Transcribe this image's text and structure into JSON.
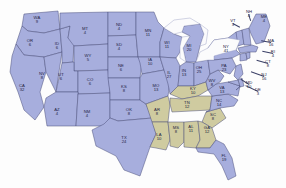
{
  "map": {
    "title": "United States Electoral College Map",
    "colors": {
      "blue_state_fill": "#a7aedd",
      "olive_state_fill": "#cfcba0",
      "border": "#4a4f7a",
      "background": "#ffffff",
      "lake_fill": "#fbfbfc",
      "label_text": "#23233f"
    },
    "legend_groups": [
      {
        "name": "blue-group",
        "color": "#a7aedd"
      },
      {
        "name": "olive-group",
        "color": "#cfcba0"
      }
    ]
  },
  "states": [
    {
      "ab": "WA",
      "ev": "9",
      "group": "blue",
      "x": 37,
      "y": 20,
      "lead": null
    },
    {
      "ab": "OR",
      "ev": "6",
      "group": "blue",
      "x": 30,
      "y": 43,
      "lead": null
    },
    {
      "ab": "CA",
      "ev": "32",
      "group": "blue",
      "x": 22,
      "y": 88,
      "lead": null
    },
    {
      "ab": "NV",
      "ev": "8",
      "group": "blue",
      "x": 42,
      "y": 76,
      "lead": null
    },
    {
      "ab": "ID",
      "ev": "6",
      "group": "blue",
      "x": 57,
      "y": 46,
      "lead": null
    },
    {
      "ab": "MT",
      "ev": "4",
      "group": "blue",
      "x": 85,
      "y": 31,
      "lead": null
    },
    {
      "ab": "WY",
      "ev": "5",
      "group": "blue",
      "x": 88,
      "y": 58,
      "lead": null
    },
    {
      "ab": "UT",
      "ev": "6",
      "group": "blue",
      "x": 61,
      "y": 77,
      "lead": null
    },
    {
      "ab": "CO",
      "ev": "6",
      "group": "blue",
      "x": 90,
      "y": 82,
      "lead": null
    },
    {
      "ab": "AZ",
      "ev": "4",
      "group": "blue",
      "x": 57,
      "y": 112,
      "lead": null
    },
    {
      "ab": "NM",
      "ev": "4",
      "group": "blue",
      "x": 87,
      "y": 114,
      "lead": null
    },
    {
      "ab": "ND",
      "ev": "4",
      "group": "blue",
      "x": 119,
      "y": 27,
      "lead": null
    },
    {
      "ab": "SD",
      "ev": "4",
      "group": "blue",
      "x": 119,
      "y": 47,
      "lead": null
    },
    {
      "ab": "NE",
      "ev": "6",
      "group": "blue",
      "x": 121,
      "y": 68,
      "lead": null
    },
    {
      "ab": "KS",
      "ev": "8",
      "group": "blue",
      "x": 124,
      "y": 89,
      "lead": null
    },
    {
      "ab": "OK",
      "ev": "8",
      "group": "blue",
      "x": 129,
      "y": 112,
      "lead": null
    },
    {
      "ab": "TX",
      "ev": "24",
      "group": "blue",
      "x": 124,
      "y": 140,
      "lead": null
    },
    {
      "ab": "MN",
      "ev": "11",
      "group": "blue",
      "x": 148,
      "y": 33,
      "lead": null
    },
    {
      "ab": "IA",
      "ev": "10",
      "group": "blue",
      "x": 150,
      "y": 62,
      "lead": null
    },
    {
      "ab": "MO",
      "ev": "13",
      "group": "blue",
      "x": 156,
      "y": 88,
      "lead": null
    },
    {
      "ab": "AR",
      "ev": "8",
      "group": "olive",
      "x": 157,
      "y": 112,
      "lead": null
    },
    {
      "ab": "LA",
      "ev": "10",
      "group": "olive",
      "x": 159,
      "y": 137,
      "lead": null
    },
    {
      "ab": "MS",
      "ev": "8",
      "group": "olive",
      "x": 176,
      "y": 130,
      "lead": null
    },
    {
      "ab": "AL",
      "ev": "11",
      "group": "olive",
      "x": 191,
      "y": 129,
      "lead": null
    },
    {
      "ab": "WI",
      "ev": "11",
      "group": "blue",
      "x": 167,
      "y": 45,
      "lead": null
    },
    {
      "ab": "IL",
      "ev": "27",
      "group": "blue",
      "x": 169,
      "y": 75,
      "lead": null
    },
    {
      "ab": "MI",
      "ev": "20",
      "group": "blue",
      "x": 189,
      "y": 48,
      "lead": null
    },
    {
      "ab": "IN",
      "ev": "13",
      "group": "blue",
      "x": 184,
      "y": 73,
      "lead": null
    },
    {
      "ab": "OH",
      "ev": "25",
      "group": "blue",
      "x": 199,
      "y": 70,
      "lead": null
    },
    {
      "ab": "KY",
      "ev": "10",
      "group": "olive",
      "x": 193,
      "y": 91,
      "lead": null
    },
    {
      "ab": "TN",
      "ev": "12",
      "group": "olive",
      "x": 187,
      "y": 105,
      "lead": null
    },
    {
      "ab": "WV",
      "ev": "8",
      "group": "blue",
      "x": 212,
      "y": 83,
      "lead": null
    },
    {
      "ab": "VA",
      "ev": "13",
      "group": "blue",
      "x": 222,
      "y": 90,
      "lead": null
    },
    {
      "ab": "NC",
      "ev": "14",
      "group": "blue",
      "x": 219,
      "y": 103,
      "lead": null
    },
    {
      "ab": "SC",
      "ev": "8",
      "group": "olive",
      "x": 213,
      "y": 117,
      "lead": null
    },
    {
      "ab": "GA",
      "ev": "12",
      "group": "olive",
      "x": 207,
      "y": 130,
      "lead": null
    },
    {
      "ab": "FL",
      "ev": "19",
      "group": "blue",
      "x": 224,
      "y": 158,
      "lead": null
    },
    {
      "ab": "NY",
      "ev": "41",
      "group": "blue",
      "x": 226,
      "y": 49,
      "lead": null
    },
    {
      "ab": "PA",
      "ev": "23",
      "group": "blue",
      "x": 224,
      "y": 68,
      "lead": null
    },
    {
      "ab": "ME",
      "ev": "4",
      "group": "blue",
      "x": 264,
      "y": 19,
      "lead": null
    },
    {
      "ab": "VT",
      "ev": "3",
      "group": "blue",
      "x": 233,
      "y": 23,
      "lead": {
        "len": 8,
        "ang": 28
      }
    },
    {
      "ab": "NH",
      "ev": "4",
      "group": "blue",
      "x": 249,
      "y": 14,
      "lead": {
        "len": 7,
        "ang": 72
      }
    },
    {
      "ab": "MA",
      "ev": "16",
      "group": "blue",
      "x": 271,
      "y": 43,
      "lead": {
        "len": 10,
        "ang": 190
      }
    },
    {
      "ab": "RI",
      "ev": "4",
      "group": "blue",
      "x": 273,
      "y": 54,
      "lead": {
        "len": 11,
        "ang": 192
      }
    },
    {
      "ab": "CT",
      "ev": "8",
      "group": "blue",
      "x": 268,
      "y": 64,
      "lead": {
        "len": 12,
        "ang": 196
      }
    },
    {
      "ab": "NJ",
      "ev": "16",
      "group": "blue",
      "x": 264,
      "y": 77,
      "lead": {
        "len": 14,
        "ang": 200
      }
    },
    {
      "ab": "DE",
      "ev": "3",
      "group": "blue",
      "x": 258,
      "y": 92,
      "lead": {
        "len": 14,
        "ang": 205
      }
    },
    {
      "ab": "MD",
      "ev": "10",
      "group": "blue",
      "x": 249,
      "y": 85,
      "lead": {
        "len": 10,
        "ang": 212
      }
    }
  ]
}
